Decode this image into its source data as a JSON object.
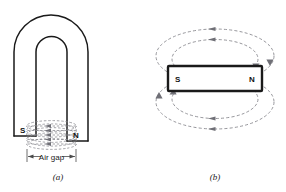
{
  "figure": {
    "background_color": "#ffffff",
    "ink_color": "#1a1a1a",
    "flux_color": "#8a8a90"
  },
  "panel_a": {
    "caption": "(a)",
    "device": "horseshoe-magnet",
    "south_pole_label": "S",
    "north_pole_label": "N",
    "gap_label": "Air gap",
    "flux_direction": "north-to-south",
    "flux_line_count": 5,
    "flux_style": "dashed-ellipse-bundle"
  },
  "panel_b": {
    "caption": "(b)",
    "device": "bar-magnet",
    "south_pole_label": "S",
    "north_pole_label": "N",
    "flux_direction": "north-to-south",
    "loop_count_above": 2,
    "loop_count_below": 2,
    "flux_style": "dashed-closed-loops"
  }
}
